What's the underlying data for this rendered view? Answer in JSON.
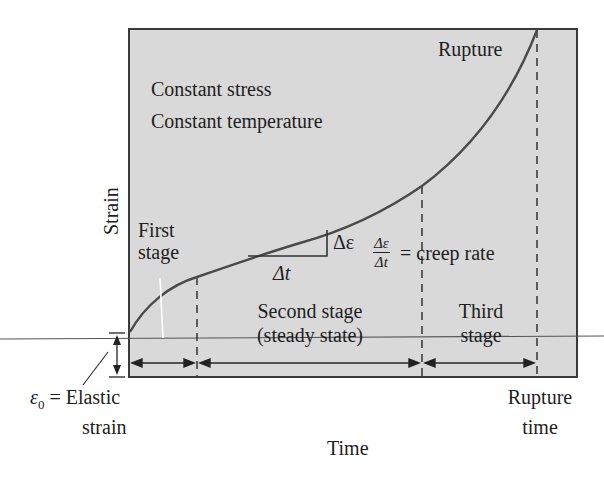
{
  "diagram": {
    "conditions": [
      "Constant stress",
      "Constant temperature"
    ],
    "axes": {
      "x_label": "Time",
      "y_label": "Strain"
    },
    "annotations": {
      "rupture": "Rupture",
      "rupture_time": [
        "Rupture",
        "time"
      ],
      "elastic_strain": {
        "symbol": "ε",
        "subscript": "0",
        "text": "= Elastic",
        "line2": "strain"
      },
      "delta_eps": "Δε",
      "delta_t": "Δt",
      "creep_rate": {
        "numerator": "Δε",
        "denominator": "Δt",
        "text": "= creep rate"
      }
    },
    "stages": [
      {
        "label_lines": [
          "First",
          "stage"
        ]
      },
      {
        "label_lines": [
          "Second stage",
          "(steady state)"
        ]
      },
      {
        "label_lines": [
          "Third",
          "stage"
        ]
      }
    ],
    "colors": {
      "plot_bg": "#d9d9d9",
      "curve": "#4a4a4a",
      "frame": "#3a3a3a",
      "text": "#1e1e1e"
    }
  }
}
